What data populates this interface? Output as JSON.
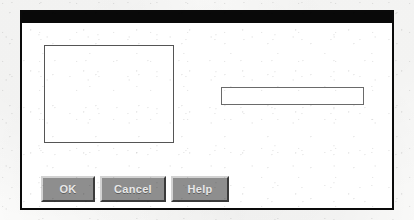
{
  "window": {
    "title": "",
    "title_bar_color": "#090909",
    "frame_color": "#0a0a0a",
    "client_background": "#ffffff"
  },
  "list_box": {
    "name": "list-box",
    "items_text": "",
    "border_color": "#555555",
    "background": "#ffffff"
  },
  "text_field": {
    "name": "text-field",
    "value": "",
    "placeholder": "",
    "border_color": "#6a6a6a",
    "background": "#ffffff"
  },
  "buttons": [
    {
      "id": "ok",
      "label": "OK"
    },
    {
      "id": "cancel",
      "label": "Cancel"
    },
    {
      "id": "help",
      "label": "Help"
    }
  ],
  "colors": {
    "button_face": "#8e8e8e",
    "button_highlight": "#d2d2d2",
    "button_shadow": "#3a3a3a",
    "button_text": "#e8e8e8",
    "page_background": "#fbfbfa"
  }
}
